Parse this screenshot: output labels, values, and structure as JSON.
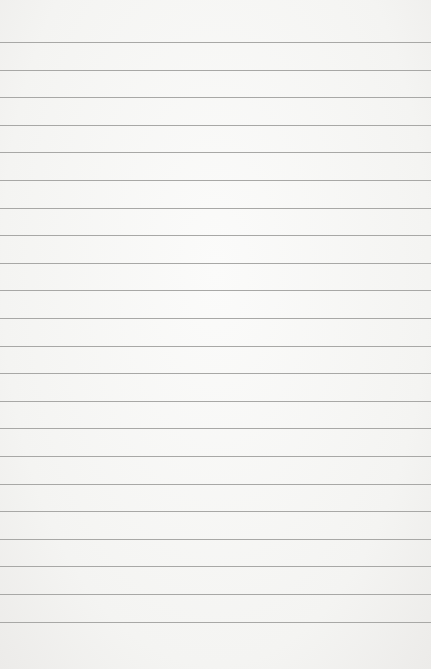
{
  "paper": {
    "description": "Blank lined notebook paper",
    "line_count": 22,
    "first_line_y": 42,
    "line_spacing": 27.6,
    "line_color": "#a8a8a6",
    "background_color": "#f6f6f4"
  }
}
